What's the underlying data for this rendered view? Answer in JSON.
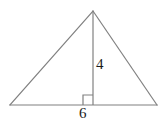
{
  "figure": {
    "kind": "geometry-diagram",
    "shape": "triangle-with-altitude",
    "background_color": "#ffffff",
    "stroke_color": "#808080",
    "text_color": "#1a1a1a",
    "stroke_width": 1.2,
    "vertices": {
      "apex": {
        "x": 93,
        "y": 11
      },
      "bottom_left": {
        "x": 10,
        "y": 105
      },
      "bottom_right": {
        "x": 157,
        "y": 105
      },
      "altitude_foot": {
        "x": 93,
        "y": 105
      }
    },
    "right_angle_marker": {
      "x": 83,
      "y": 95,
      "size": 10,
      "position": "left-of-altitude"
    },
    "labels": {
      "height": "4",
      "base": "6"
    }
  }
}
